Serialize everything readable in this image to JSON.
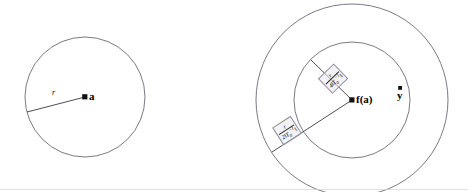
{
  "figure": {
    "background_color": "#ffffff",
    "stroke_color": "#6a6a78",
    "text_color": "#000000",
    "label_box_fill": "#eaeaee",
    "label_box_border": "#8e8e9c"
  },
  "left_diagram": {
    "name": "domain-circle",
    "circle": {
      "cx": 85,
      "cy": 97,
      "r": 60
    },
    "center_point": {
      "cx": 85,
      "cy": 97,
      "label": "a"
    },
    "radius_line": {
      "x1": 85,
      "y1": 97,
      "x2": 27,
      "y2": 112,
      "label": "r"
    }
  },
  "right_diagram": {
    "name": "image-circles",
    "outer_circle": {
      "cx": 352,
      "cy": 100,
      "r": 96
    },
    "inner_circle": {
      "cx": 352,
      "cy": 100,
      "r": 58
    },
    "center_point": {
      "cx": 352,
      "cy": 100,
      "label": "f(a)"
    },
    "y_point": {
      "cx": 400,
      "cy": 93,
      "label": "y"
    },
    "radius_upper": {
      "x1": 352,
      "y1": 100,
      "x2": 311,
      "y2": 60,
      "numerator": "r",
      "denominator_coeff": "4",
      "denominator_norm": "‖T",
      "denominator_sub": "0",
      "denominator_sup": "−1",
      "denominator_norm_close": "‖"
    },
    "radius_lower": {
      "x1": 352,
      "y1": 100,
      "x2": 272,
      "y2": 152,
      "numerator": "r",
      "denominator_coeff": "2",
      "denominator_norm": "‖T",
      "denominator_sub": "0",
      "denominator_sup": "−1",
      "denominator_norm_close": "‖"
    }
  },
  "footer_rule": {
    "name": "bottom-hairline",
    "y": 189
  }
}
